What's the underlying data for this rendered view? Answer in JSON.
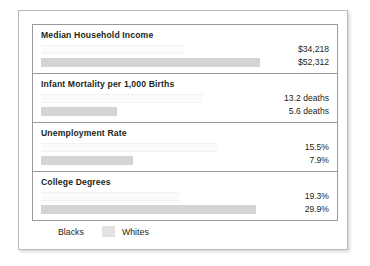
{
  "legend": {
    "entries": [
      {
        "label": "Blacks",
        "color": "#ffffff",
        "swatch_name": "blacks-swatch"
      },
      {
        "label": "Whites",
        "color": "#e2e2e2",
        "swatch_name": "whites-swatch"
      }
    ]
  },
  "panels": [
    {
      "title": "Median Household Income",
      "blacks_value": "$34,218",
      "whites_value": "$52,312",
      "blacks_pct": 62,
      "whites_pct": 95
    },
    {
      "title": "Infant Mortality per 1,000 Births",
      "blacks_value": "13.2 deaths",
      "whites_value": "5.6 deaths",
      "blacks_pct": 70,
      "whites_pct": 33
    },
    {
      "title": "Unemployment Rate",
      "blacks_value": "15.5%",
      "whites_value": "7.9%",
      "blacks_pct": 76,
      "whites_pct": 40
    },
    {
      "title": "College Degrees",
      "blacks_value": "19.3%",
      "whites_value": "29.9%",
      "blacks_pct": 60,
      "whites_pct": 93
    }
  ],
  "chart_data": {
    "type": "bar",
    "title": "",
    "subtitle": "",
    "xlabel": "",
    "ylabel": "",
    "orientation": "horizontal",
    "grid": false,
    "legend_position": "bottom-left",
    "categories": [
      "Median Household Income",
      "Infant Mortality per 1,000 Births",
      "Unemployment Rate",
      "College Degrees"
    ],
    "series": [
      {
        "name": "Blacks",
        "color": "#ffffff",
        "values": [
          34218,
          13.2,
          15.5,
          19.3
        ],
        "labels": [
          "$34,218",
          "13.2 deaths",
          "15.5%",
          "19.3%"
        ]
      },
      {
        "name": "Whites",
        "color": "#e2e2e2",
        "values": [
          52312,
          5.6,
          7.9,
          29.9
        ],
        "labels": [
          "$52,312",
          "5.6 deaths",
          "7.9%",
          "29.9%"
        ]
      }
    ],
    "units": [
      "US dollars",
      "deaths per 1,000 births",
      "percent",
      "percent"
    ]
  }
}
